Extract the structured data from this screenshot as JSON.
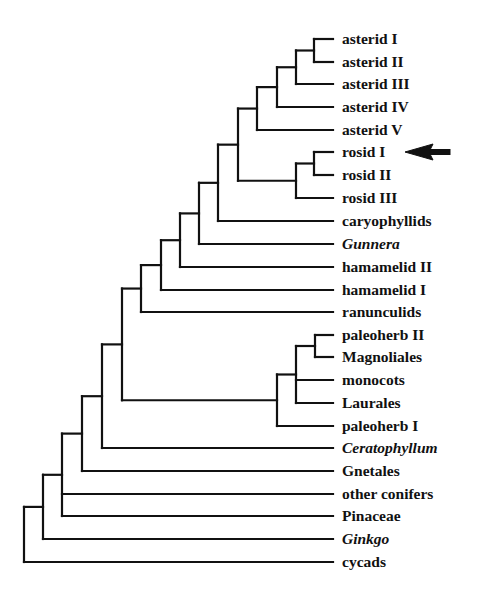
{
  "figure": {
    "type": "phylogenetic-tree",
    "line_color": "#111111",
    "background": "#ffffff",
    "label_x": 342,
    "leaf_line_end_x": 333,
    "highlight_arrow": {
      "target": "rosid I",
      "tip_x": 405,
      "tail_x": 450,
      "y": 152
    }
  },
  "leaves": [
    {
      "id": "asterid_1",
      "label": "asterid I",
      "italic": false,
      "y": 39
    },
    {
      "id": "asterid_2",
      "label": "asterid II",
      "italic": false,
      "y": 62
    },
    {
      "id": "asterid_3",
      "label": "asterid III",
      "italic": false,
      "y": 84
    },
    {
      "id": "asterid_4",
      "label": "asterid IV",
      "italic": false,
      "y": 107
    },
    {
      "id": "asterid_5",
      "label": "asterid V",
      "italic": false,
      "y": 130
    },
    {
      "id": "rosid_1",
      "label": "rosid I",
      "italic": false,
      "y": 152
    },
    {
      "id": "rosid_2",
      "label": "rosid II",
      "italic": false,
      "y": 175
    },
    {
      "id": "rosid_3",
      "label": "rosid III",
      "italic": false,
      "y": 198
    },
    {
      "id": "caryophyllids",
      "label": "caryophyllids",
      "italic": false,
      "y": 221
    },
    {
      "id": "gunnera",
      "label": "Gunnera",
      "italic": true,
      "y": 244
    },
    {
      "id": "hamamelid_2",
      "label": "hamamelid II",
      "italic": false,
      "y": 267
    },
    {
      "id": "hamamelid_1",
      "label": "hamamelid I",
      "italic": false,
      "y": 290
    },
    {
      "id": "ranunculids",
      "label": "ranunculids",
      "italic": false,
      "y": 312
    },
    {
      "id": "paleoherb_2",
      "label": "paleoherb II",
      "italic": false,
      "y": 335
    },
    {
      "id": "magnoliales",
      "label": "Magnoliales",
      "italic": false,
      "y": 357
    },
    {
      "id": "monocots",
      "label": "monocots",
      "italic": false,
      "y": 380
    },
    {
      "id": "laurales",
      "label": "Laurales",
      "italic": false,
      "y": 403
    },
    {
      "id": "paleoherb_1",
      "label": "paleoherb I",
      "italic": false,
      "y": 426
    },
    {
      "id": "ceratophyllum",
      "label": "Ceratophyllum",
      "italic": true,
      "y": 448
    },
    {
      "id": "gnetales",
      "label": "Gnetales",
      "italic": false,
      "y": 471
    },
    {
      "id": "other_conifers",
      "label": "other conifers",
      "italic": false,
      "y": 494
    },
    {
      "id": "pinaceae",
      "label": "Pinaceae",
      "italic": false,
      "y": 516
    },
    {
      "id": "ginkgo",
      "label": "Ginkgo",
      "italic": true,
      "y": 539
    },
    {
      "id": "cycads",
      "label": "cycads",
      "italic": false,
      "y": 562
    }
  ],
  "nodes": [
    {
      "id": "n_ast12",
      "x": 314,
      "children": [
        "asterid_1",
        "asterid_2"
      ]
    },
    {
      "id": "n_ast123",
      "x": 296,
      "children": [
        "n_ast12",
        "asterid_3"
      ]
    },
    {
      "id": "n_ast1234",
      "x": 277,
      "children": [
        "n_ast123",
        "asterid_4"
      ]
    },
    {
      "id": "n_asterids",
      "x": 257,
      "children": [
        "n_ast1234",
        "asterid_5"
      ]
    },
    {
      "id": "n_ros12",
      "x": 314,
      "children": [
        "rosid_1",
        "rosid_2"
      ]
    },
    {
      "id": "n_rosids",
      "x": 296,
      "children": [
        "n_ros12",
        "rosid_3"
      ]
    },
    {
      "id": "n_ast_ros",
      "x": 238,
      "children": [
        "n_asterids",
        "n_rosids"
      ]
    },
    {
      "id": "n_caryo",
      "x": 218,
      "children": [
        "n_ast_ros",
        "caryophyllids"
      ]
    },
    {
      "id": "n_gunnera",
      "x": 199,
      "children": [
        "n_caryo",
        "gunnera"
      ]
    },
    {
      "id": "n_ham2",
      "x": 180,
      "children": [
        "n_gunnera",
        "hamamelid_2"
      ]
    },
    {
      "id": "n_ham1",
      "x": 161,
      "children": [
        "n_ham2",
        "hamamelid_1"
      ]
    },
    {
      "id": "n_eudicots",
      "x": 141,
      "children": [
        "n_ham1",
        "ranunculids"
      ]
    },
    {
      "id": "n_pal2_mag",
      "x": 315,
      "children": [
        "paleoherb_2",
        "magnoliales"
      ]
    },
    {
      "id": "n_poly",
      "x": 296,
      "children": [
        "n_pal2_mag",
        "monocots",
        "laurales"
      ]
    },
    {
      "id": "n_paleo",
      "x": 277,
      "children": [
        "n_poly",
        "paleoherb_1"
      ]
    },
    {
      "id": "n_angio_core",
      "x": 122,
      "children": [
        "n_eudicots",
        "n_paleo"
      ]
    },
    {
      "id": "n_angio",
      "x": 102,
      "children": [
        "n_angio_core",
        "ceratophyllum"
      ]
    },
    {
      "id": "n_gnet",
      "x": 82,
      "children": [
        "n_angio",
        "gnetales"
      ]
    },
    {
      "id": "n_conifers",
      "x": 62,
      "children": [
        "n_gnet",
        "other_conifers",
        "pinaceae"
      ]
    },
    {
      "id": "n_ginkgo",
      "x": 43,
      "children": [
        "n_conifers",
        "ginkgo"
      ]
    },
    {
      "id": "n_root",
      "x": 24,
      "children": [
        "n_ginkgo",
        "cycads"
      ]
    }
  ]
}
